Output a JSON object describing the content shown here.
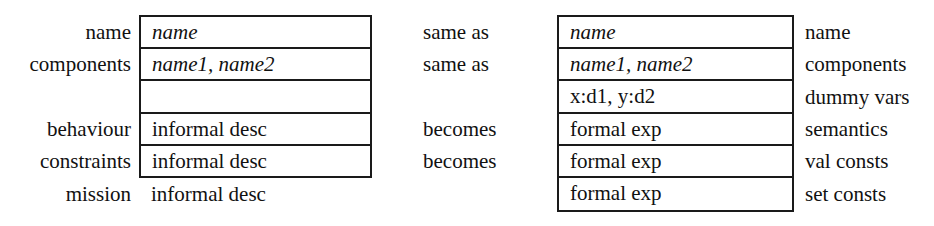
{
  "left_spec": {
    "rows": [
      {
        "label": "name",
        "value": "name",
        "italic": true
      },
      {
        "label": "components",
        "value": "name1, name2",
        "italic": true
      },
      {
        "label": "",
        "value": "",
        "italic": false
      },
      {
        "label": "behaviour",
        "value": "informal desc",
        "italic": false
      },
      {
        "label": "constraints",
        "value": "informal desc",
        "italic": false
      }
    ],
    "outside_row": {
      "label": "mission",
      "value": "informal desc"
    }
  },
  "mapping": [
    {
      "row": 0,
      "text": "same as"
    },
    {
      "row": 1,
      "text": "same as"
    },
    {
      "row": 3,
      "text": "becomes"
    },
    {
      "row": 4,
      "text": "becomes"
    }
  ],
  "right_spec": {
    "rows": [
      {
        "value": "name",
        "label": "name",
        "italic": true
      },
      {
        "value": "name1, name2",
        "label": "components",
        "italic": true
      },
      {
        "value": "x:d1, y:d2",
        "label": "dummy vars",
        "italic": false
      },
      {
        "value": "formal exp",
        "label": "semantics",
        "italic": false
      },
      {
        "value": "formal exp",
        "label": "val consts",
        "italic": false
      },
      {
        "value": "formal exp",
        "label": "set consts",
        "italic": false
      }
    ]
  }
}
